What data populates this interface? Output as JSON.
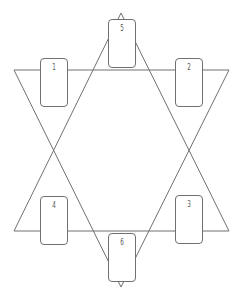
{
  "diagram": {
    "type": "card-spread",
    "shape": "hexagram",
    "line_color": "#707070",
    "triangles": [
      {
        "name": "down-triangle",
        "points": [
          [
            14,
            70
          ],
          [
            229,
            70
          ],
          [
            121,
            287
          ]
        ]
      },
      {
        "name": "up-triangle",
        "points": [
          [
            14,
            231
          ],
          [
            229,
            231
          ],
          [
            121,
            13
          ]
        ]
      }
    ],
    "cards": [
      {
        "label": "1",
        "x": 40,
        "y": 58
      },
      {
        "label": "2",
        "x": 175,
        "y": 58
      },
      {
        "label": "3",
        "x": 175,
        "y": 195
      },
      {
        "label": "4",
        "x": 40,
        "y": 196
      },
      {
        "label": "5",
        "x": 108,
        "y": 19
      },
      {
        "label": "6",
        "x": 108,
        "y": 233
      }
    ]
  }
}
